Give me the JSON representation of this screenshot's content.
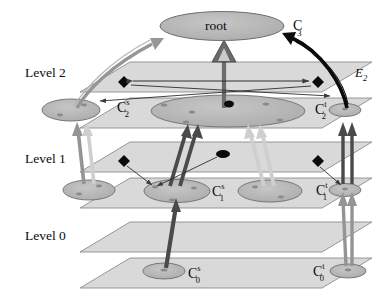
{
  "figure": {
    "type": "hierarchical-graph-diagram",
    "levels": [
      {
        "id": "level-2",
        "label": "Level 2"
      },
      {
        "id": "level-1",
        "label": "Level 1"
      },
      {
        "id": "level-0",
        "label": "Level 0"
      }
    ],
    "root": {
      "label": "root",
      "cluster_label_base": "C",
      "cluster_label_sub": "3",
      "cluster_label_sup": ""
    },
    "edge_label": {
      "base": "E",
      "sub": "2"
    },
    "nodes": [
      {
        "id": "c2s",
        "base": "C",
        "sub": "2",
        "sup": "s"
      },
      {
        "id": "c2t",
        "base": "C",
        "sub": "2",
        "sup": "t"
      },
      {
        "id": "c1s",
        "base": "C",
        "sub": "1",
        "sup": "s"
      },
      {
        "id": "c1t",
        "base": "C",
        "sub": "1",
        "sup": "t"
      },
      {
        "id": "c0s",
        "base": "C",
        "sub": "0",
        "sup": "s"
      },
      {
        "id": "c0t",
        "base": "C",
        "sub": "0",
        "sup": "t"
      }
    ],
    "colors": {
      "plane_fill": "#d9d9d9",
      "plane_stroke": "#8c8c8c",
      "ellipse_fill": "#b8b8b8",
      "ellipse_stroke": "#6e6e6e",
      "arrow_gray": "#949494",
      "arrow_dark": "#4a4a4a",
      "marker_black": "#0b0b0b",
      "text": "#0b0b0b"
    }
  }
}
